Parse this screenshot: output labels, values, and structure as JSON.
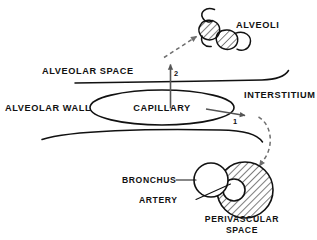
{
  "figure": {
    "background_color": "#ffffff",
    "ink_color": "#111111",
    "arrow_color": "#555555",
    "dashed_arrow_color": "#6e6e6e"
  },
  "labels": {
    "alveoli": "ALVEOLI",
    "alveolar_space": "ALVEOLAR SPACE",
    "alveolar_wall": "ALVEOLAR WALL",
    "capillary": "CAPILLARY",
    "interstitium": "INTERSTITIUM",
    "bronchus": "BRONCHUS",
    "artery": "ARTERY",
    "perivascular_space_line1": "PERIVASCULAR",
    "perivascular_space_line2": "SPACE"
  },
  "pathway_markers": {
    "marker_one": "1",
    "marker_two": "2"
  },
  "structures": [
    {
      "name": "alveoli-cluster",
      "description": "Two hatched alveolar sacs with open C-shaped arcs",
      "count": 2
    },
    {
      "name": "capillary-ellipse",
      "description": "Open ellipse labelled CAPILLARY"
    },
    {
      "name": "alveolar-space-boundary",
      "description": "Upper curved membrane line"
    },
    {
      "name": "interstitium-boundary",
      "description": "Lower curved membrane line"
    },
    {
      "name": "bronchus-circle",
      "description": "Plain circle, airway"
    },
    {
      "name": "artery-circle",
      "description": "Small inner circle inside hatched region"
    },
    {
      "name": "perivascular-space-circle",
      "description": "Hatched circle surrounding artery"
    }
  ],
  "flows": [
    {
      "id": "2",
      "from": "capillary",
      "to": "alveoli",
      "style": "solid-then-dashed",
      "direction": "up-right"
    },
    {
      "id": "1",
      "from": "capillary",
      "to": "perivascular-space",
      "style": "solid-then-dashed",
      "direction": "right-then-down"
    }
  ]
}
